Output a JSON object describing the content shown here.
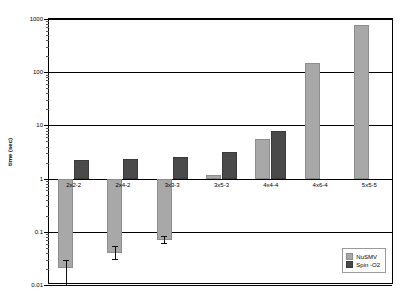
{
  "chart_data": {
    "type": "bar",
    "title": "",
    "xlabel": "",
    "ylabel": "time (sec)",
    "yscale": "log",
    "ylim": [
      0.01,
      1000
    ],
    "ytick_labels": [
      "1000",
      "100",
      "10",
      "1",
      "0.1",
      "0.01"
    ],
    "ytick_values": [
      1000,
      100,
      10,
      1,
      0.1,
      0.01
    ],
    "grid": true,
    "baseline": 1,
    "legend_position": "bottom-right",
    "categories": [
      "2x2-2",
      "2x4-2",
      "3x3-3",
      "3x5-3",
      "4x4-4",
      "4x6-4",
      "5x5-5"
    ],
    "series": [
      {
        "name": "NuSMV",
        "color": "#a8a8a8",
        "values": [
          0.021,
          0.04,
          0.07,
          1.15,
          5.5,
          150,
          780
        ],
        "error_low": [
          0.01,
          0.031,
          0.062,
          null,
          null,
          null,
          null
        ],
        "error_high": [
          0.03,
          0.053,
          0.082,
          null,
          null,
          null,
          null
        ]
      },
      {
        "name": "Spin -O2",
        "color": "#4a4a4a",
        "values": [
          2.25,
          2.35,
          2.6,
          3.1,
          8.0,
          null,
          null
        ],
        "error_low": [
          null,
          null,
          null,
          null,
          null,
          null,
          null
        ],
        "error_high": [
          null,
          null,
          null,
          null,
          null,
          null,
          null
        ]
      }
    ]
  },
  "legend": {
    "entries": [
      {
        "label": "NuSMV"
      },
      {
        "label": "Spin -O2"
      }
    ]
  }
}
